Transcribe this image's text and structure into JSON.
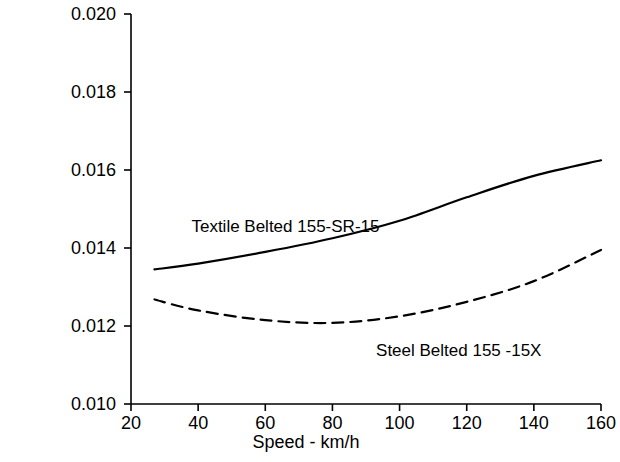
{
  "chart_data": {
    "type": "line",
    "title": "",
    "xlabel": "Speed - km/h",
    "ylabel": "Rolling Resistance Coefficient",
    "xlim": [
      20,
      160
    ],
    "ylim": [
      0.01,
      0.02
    ],
    "xticks": [
      "20",
      "40",
      "60",
      "80",
      "100",
      "120",
      "140",
      "160"
    ],
    "xtick_values": [
      20,
      40,
      60,
      80,
      100,
      120,
      140,
      160
    ],
    "yticks": [
      "0.010",
      "0.012",
      "0.014",
      "0.016",
      "0.018",
      "0.020"
    ],
    "ytick_values": [
      0.01,
      0.012,
      0.014,
      0.016,
      0.018,
      0.02
    ],
    "grid": false,
    "legend_position": "inline-annotations",
    "series": [
      {
        "name": "Textile Belted 155-SR-15",
        "style": "solid",
        "color": "#000000",
        "x": [
          27,
          40,
          60,
          80,
          100,
          120,
          140,
          160
        ],
        "values": [
          0.01345,
          0.0136,
          0.0139,
          0.01425,
          0.0147,
          0.0153,
          0.01585,
          0.01625
        ]
      },
      {
        "name": "Steel Belted 155 -15X",
        "style": "dashed",
        "color": "#000000",
        "x": [
          27,
          40,
          60,
          80,
          100,
          120,
          140,
          160
        ],
        "values": [
          0.01268,
          0.0124,
          0.01215,
          0.01208,
          0.01225,
          0.01262,
          0.01315,
          0.01395
        ]
      }
    ],
    "annotations": [
      {
        "text": "Textile Belted 155-SR-15",
        "x": 38,
        "y": 0.01455
      },
      {
        "text": "Steel Belted 155 -15X",
        "x": 93,
        "y": 0.01135
      }
    ]
  }
}
